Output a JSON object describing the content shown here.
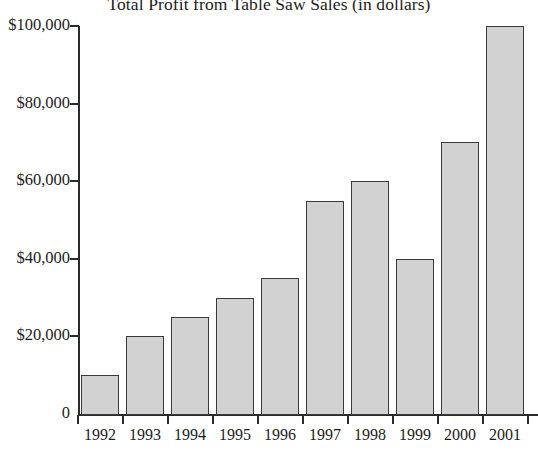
{
  "chart_data": {
    "type": "bar",
    "title": "Total Profit from Table Saw Sales (in dollars)",
    "xlabel": "",
    "ylabel": "",
    "categories": [
      "1992",
      "1993",
      "1994",
      "1995",
      "1996",
      "1997",
      "1998",
      "1999",
      "2000",
      "2001"
    ],
    "values": [
      10000,
      20000,
      25000,
      30000,
      35000,
      55000,
      60000,
      40000,
      70000,
      100000
    ],
    "ylim": [
      0,
      100000
    ],
    "ytick_values": [
      0,
      20000,
      40000,
      60000,
      80000,
      100000
    ],
    "ytick_labels": [
      "0",
      "$20,000",
      "$40,000",
      "$60,000",
      "$80,000",
      "$100,000"
    ],
    "grid": false,
    "legend": null,
    "bar_color": "#d2d2d2",
    "bar_edge_color": "#3a3a3a",
    "axis_color": "#2b2b2b"
  }
}
